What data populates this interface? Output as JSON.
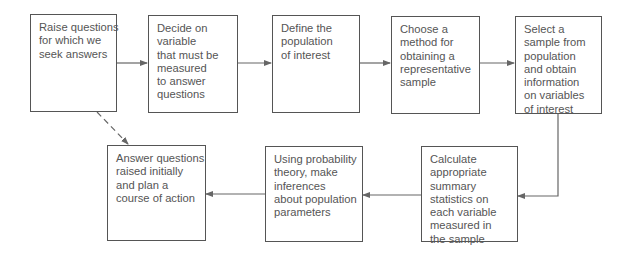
{
  "diagram": {
    "title": "",
    "type": "flowchart",
    "nodes": [
      {
        "id": "n1",
        "lines": [
          "Raise questions",
          "for which we",
          "seek answers"
        ]
      },
      {
        "id": "n2",
        "lines": [
          "Decide on",
          "variable",
          "that must be",
          "measured",
          "to answer",
          "questions"
        ]
      },
      {
        "id": "n3",
        "lines": [
          "Define the",
          "population",
          "of interest"
        ]
      },
      {
        "id": "n4",
        "lines": [
          "Choose a",
          "method for",
          "obtaining a",
          "representative",
          "sample"
        ]
      },
      {
        "id": "n5",
        "lines": [
          "Select a",
          "sample from",
          "population",
          "and obtain",
          "information",
          "on variables",
          "of interest"
        ]
      },
      {
        "id": "n6",
        "lines": [
          "Calculate",
          "appropriate",
          "summary",
          "statistics on",
          "each variable",
          "measured in",
          "the sample"
        ]
      },
      {
        "id": "n7",
        "lines": [
          "Using probability",
          "theory, make",
          "inferences",
          "about population",
          "parameters"
        ]
      },
      {
        "id": "n8",
        "lines": [
          "Answer questions",
          "raised initially",
          "and plan a",
          "course of action"
        ]
      }
    ],
    "edges": [
      {
        "from": "n1",
        "to": "n2",
        "style": "solid"
      },
      {
        "from": "n2",
        "to": "n3",
        "style": "solid"
      },
      {
        "from": "n3",
        "to": "n4",
        "style": "solid"
      },
      {
        "from": "n4",
        "to": "n5",
        "style": "solid"
      },
      {
        "from": "n5",
        "to": "n6",
        "style": "solid"
      },
      {
        "from": "n6",
        "to": "n7",
        "style": "solid"
      },
      {
        "from": "n7",
        "to": "n8",
        "style": "solid"
      },
      {
        "from": "n1",
        "to": "n8",
        "style": "dashed"
      }
    ],
    "colors": {
      "line": "#555555",
      "text": "#555555",
      "background": "#ffffff"
    }
  }
}
